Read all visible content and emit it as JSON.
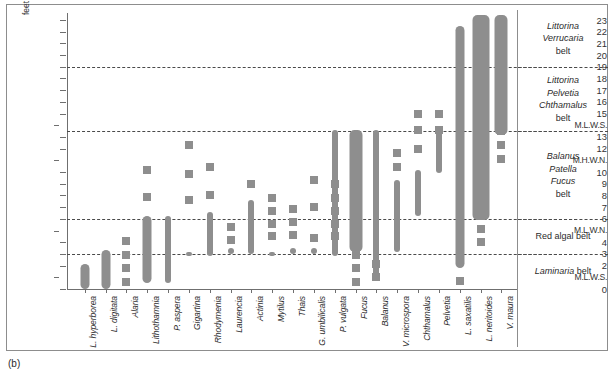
{
  "figure": {
    "panel_label": "(b)",
    "axis_unit_label": "feet",
    "bar_color": "#8e8e8e",
    "frame_color": "#8d8d8d"
  },
  "chart_data": {
    "type": "bar",
    "title": "",
    "subtitle": "",
    "xlabel": "",
    "ylabel": "feet",
    "ylim": [
      0,
      23.6
    ],
    "grid": "horizontal dashed zone boundaries only",
    "legend": "none",
    "orientation": "vertical ranges (vertical distribution of shore organisms)",
    "y_tick_values": [
      0,
      1,
      2,
      3,
      4,
      5,
      6,
      7,
      8,
      9,
      10,
      11,
      12,
      13,
      14,
      15,
      16,
      17,
      18,
      19,
      20,
      21,
      22,
      23
    ],
    "y_tick_labels": [
      "0",
      "M.L.W.S.",
      "2",
      "3",
      "4",
      "M.L.W.N.",
      "6",
      "7",
      "8",
      "9",
      "10",
      "M.H.W.N.",
      "12",
      "13",
      "M.L.W.S.",
      "15",
      "16",
      "17",
      "18",
      "19",
      "20",
      "21",
      "22",
      "23"
    ],
    "tidal_levels": [
      {
        "name": "M.L.W.S.",
        "feet": 1
      },
      {
        "name": "M.L.W.N.",
        "feet": 5
      },
      {
        "name": "M.H.W.N.",
        "feet": 11
      },
      {
        "name": "M.L.W.S.",
        "feet": 14
      }
    ],
    "zone_boundaries_feet": [
      19,
      13.5,
      6,
      3
    ],
    "categories": [
      "L. hyperborea",
      "L. digitata",
      "Alaria",
      "Lithothamnia",
      "P. aspera",
      "Gigartina",
      "Rhodymenia",
      "Laurencia",
      "Actinia",
      "Mytilus",
      "Thais",
      "G. umbilicalis",
      "P. vulgata",
      "Fucus",
      "Balanus",
      "V. microspora",
      "Chthamalus",
      "Pelvetia",
      "L. saxatilis",
      "L. neritoides",
      "V. maura"
    ],
    "series": [
      {
        "name": "vertical range (continuous core)",
        "values_feet": [
          [
            0.0,
            2.1
          ],
          [
            0.0,
            3.3
          ],
          [
            0.0,
            0.0
          ],
          [
            0.5,
            6.2
          ],
          [
            0.5,
            6.2
          ],
          [
            2.8,
            3.2
          ],
          [
            2.8,
            6.6
          ],
          [
            3.0,
            3.5
          ],
          [
            3.0,
            7.6
          ],
          [
            2.8,
            3.2
          ],
          [
            3.0,
            3.5
          ],
          [
            3.0,
            3.5
          ],
          [
            2.8,
            13.6
          ],
          [
            3.2,
            13.6
          ],
          [
            0.8,
            13.6
          ],
          [
            3.2,
            9.3
          ],
          [
            6.2,
            10.2
          ],
          [
            9.9,
            13.7
          ],
          [
            1.8,
            22.5
          ],
          [
            5.9,
            23.4
          ],
          [
            13.2,
            23.4
          ]
        ]
      },
      {
        "name": "scattered occurrences (discrete squares)",
        "points_feet": [
          {
            "species": "Alaria",
            "values": [
              0.6,
              1.8,
              2.9,
              4.1
            ]
          },
          {
            "species": "Lithothamnia",
            "values": [
              7.9,
              10.2
            ]
          },
          {
            "species": "Gigartina",
            "values": [
              7.6,
              9.8,
              12.3
            ]
          },
          {
            "species": "Rhodymenia",
            "values": [
              8.0,
              10.4
            ]
          },
          {
            "species": "Laurencia",
            "values": [
              4.2,
              5.3
            ]
          },
          {
            "species": "Actinia",
            "values": [
              9.0
            ]
          },
          {
            "species": "Mytilus",
            "values": [
              4.5,
              5.6,
              6.7,
              7.8
            ]
          },
          {
            "species": "Thais",
            "values": [
              4.6,
              5.7,
              6.8
            ]
          },
          {
            "species": "G. umbilicalis",
            "values": [
              4.4,
              7.0,
              9.3
            ]
          },
          {
            "species": "P. vulgata",
            "values": [
              4.5,
              5.6,
              6.7,
              7.8,
              9.0
            ]
          },
          {
            "species": "Fucus",
            "values": [
              0.6,
              1.8,
              2.9,
              7.2,
              8.5,
              9.8,
              11.1
            ]
          },
          {
            "species": "Balanus",
            "values": [
              1.0,
              2.1
            ]
          },
          {
            "species": "V. microspora",
            "values": [
              10.4,
              11.6
            ]
          },
          {
            "species": "Chthamalus",
            "values": [
              12.0,
              13.6,
              15.0
            ]
          },
          {
            "species": "Pelvetia",
            "values": [
              13.6,
              15.0
            ]
          },
          {
            "species": "L. saxatilis",
            "values": [
              0.7,
              4.2,
              5.3,
              19.3,
              20.6,
              21.8
            ]
          },
          {
            "species": "L. neritoides",
            "values": [
              4.0,
              5.1
            ]
          },
          {
            "species": "V. maura",
            "values": [
              11.1,
              12.3,
              13.5
            ]
          }
        ]
      }
    ]
  },
  "zones": [
    {
      "lines": [
        "Littorina",
        "Verrucaria"
      ],
      "italic_count": 2,
      "suffix": "belt"
    },
    {
      "lines": [
        "Littorina",
        "Pelvetia",
        "Chthamalus"
      ],
      "italic_count": 3,
      "suffix": "belt"
    },
    {
      "lines": [
        "Balanus",
        "Patella",
        "Fucus"
      ],
      "italic_count": 3,
      "suffix": "belt"
    },
    {
      "lines": [
        "Red algal belt"
      ],
      "italic_count": 0,
      "suffix": ""
    },
    {
      "lines": [
        "Laminaria"
      ],
      "italic_count": 1,
      "suffix": "belt"
    }
  ]
}
